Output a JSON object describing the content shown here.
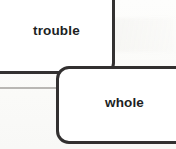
{
  "diagram": {
    "type": "flowchart-fragment",
    "background_color": "#fbfbfa",
    "stroke_color": "#333131",
    "text_color": "#201f1f",
    "nodes": [
      {
        "id": "trouble",
        "label": "trouble",
        "shape": "rounded-rectangle",
        "clipped_edges": "top,left"
      },
      {
        "id": "whole",
        "label": "whole",
        "shape": "rounded-rectangle",
        "clipped_edges": "right"
      }
    ],
    "connectors": [
      {
        "id": "thin-left-connector",
        "style": "thin-line",
        "color": "#b9b7b4",
        "from": "off-canvas-left",
        "to": "whole"
      }
    ]
  }
}
